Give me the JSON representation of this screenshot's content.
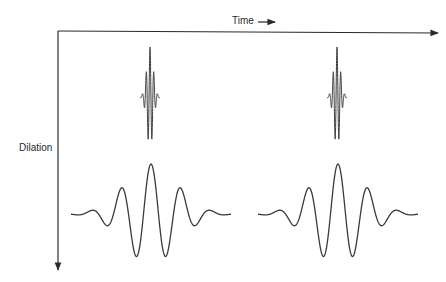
{
  "diagram": {
    "axes": {
      "horizontal": {
        "label": "Time",
        "arrow": "→"
      },
      "vertical": {
        "label": "Dilation"
      }
    },
    "wavelets": [
      {
        "name": "small-scale-wavelet-left",
        "scale": "small",
        "center_x": 150,
        "baseline_y": 97
      },
      {
        "name": "small-scale-wavelet-right",
        "scale": "small",
        "center_x": 337,
        "baseline_y": 97
      },
      {
        "name": "large-scale-wavelet-left",
        "scale": "large",
        "center_x": 151,
        "baseline_y": 214
      },
      {
        "name": "large-scale-wavelet-right",
        "scale": "large",
        "center_x": 338,
        "baseline_y": 214
      }
    ],
    "line_color": "#3a3a3a"
  }
}
